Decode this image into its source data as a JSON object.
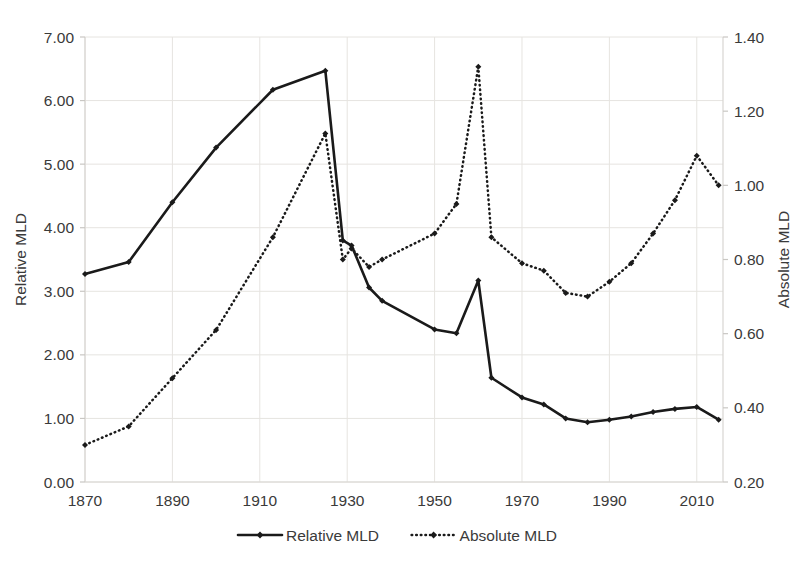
{
  "chart_data": {
    "type": "line",
    "title": "",
    "xlabel": "",
    "ylabel": "Relative MLD",
    "y2label": "Absolute MLD",
    "xlim": [
      1870,
      2016
    ],
    "ylim": [
      0.0,
      7.0
    ],
    "y2lim": [
      0.2,
      1.4
    ],
    "grid": true,
    "legend_position": "bottom-center",
    "x_ticks": [
      "1870",
      "1890",
      "1910",
      "1930",
      "1950",
      "1970",
      "1990",
      "2010"
    ],
    "x_tick_values": [
      1870,
      1890,
      1910,
      1930,
      1950,
      1970,
      1990,
      2010
    ],
    "y_ticks": [
      "0.00",
      "1.00",
      "2.00",
      "3.00",
      "4.00",
      "5.00",
      "6.00",
      "7.00"
    ],
    "y_tick_values": [
      0.0,
      1.0,
      2.0,
      3.0,
      4.0,
      5.0,
      6.0,
      7.0
    ],
    "y2_ticks": [
      "0.20",
      "0.40",
      "0.60",
      "0.80",
      "1.00",
      "1.20",
      "1.40"
    ],
    "y2_tick_values": [
      0.2,
      0.4,
      0.6,
      0.8,
      1.0,
      1.2,
      1.4
    ],
    "series": [
      {
        "name": "Relative MLD",
        "axis": "left",
        "style": "solid",
        "marker": "diamond",
        "color": "#1a1a1a",
        "x": [
          1870,
          1880,
          1890,
          1900,
          1913,
          1925,
          1929,
          1931,
          1935,
          1938,
          1950,
          1955,
          1960,
          1963,
          1970,
          1975,
          1980,
          1985,
          1990,
          1995,
          2000,
          2005,
          2010,
          2015
        ],
        "values": [
          3.27,
          3.46,
          4.4,
          5.26,
          6.17,
          6.47,
          3.8,
          3.72,
          3.06,
          2.85,
          2.4,
          2.34,
          3.17,
          1.64,
          1.33,
          1.22,
          1.0,
          0.94,
          0.98,
          1.03,
          1.1,
          1.15,
          1.18,
          0.98
        ]
      },
      {
        "name": "Absolute MLD",
        "axis": "right",
        "style": "dotted",
        "marker": "diamond",
        "color": "#1a1a1a",
        "x": [
          1870,
          1880,
          1890,
          1900,
          1913,
          1925,
          1929,
          1931,
          1935,
          1938,
          1950,
          1955,
          1960,
          1963,
          1970,
          1975,
          1980,
          1985,
          1990,
          1995,
          2000,
          2005,
          2010,
          2015
        ],
        "values": [
          0.3,
          0.35,
          0.48,
          0.61,
          0.86,
          1.14,
          0.8,
          0.83,
          0.78,
          0.8,
          0.87,
          0.95,
          1.32,
          0.86,
          0.79,
          0.77,
          0.71,
          0.7,
          0.74,
          0.79,
          0.87,
          0.96,
          1.08,
          1.0
        ]
      }
    ],
    "legend": [
      {
        "label": "Relative MLD",
        "style": "solid"
      },
      {
        "label": "Absolute MLD",
        "style": "dotted"
      }
    ]
  }
}
